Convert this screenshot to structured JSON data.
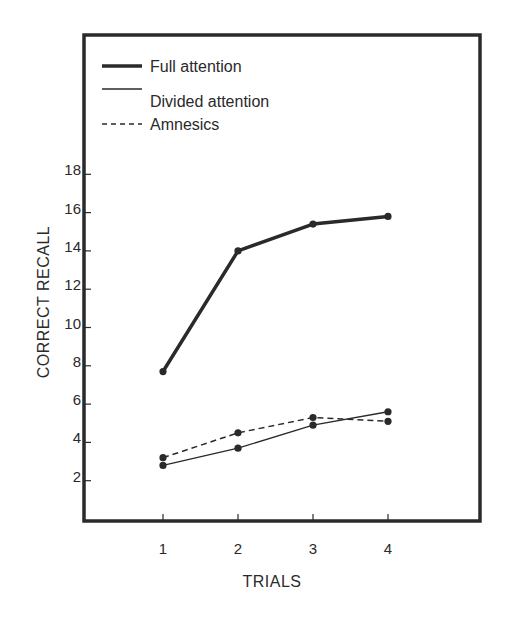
{
  "chart_data": {
    "type": "line",
    "title": "",
    "xlabel": "TRIALS",
    "ylabel": "CORRECT RECALL",
    "x": [
      1,
      2,
      3,
      4
    ],
    "x_tick_labels": [
      "1",
      "2",
      "3",
      "4"
    ],
    "y_ticks": [
      2,
      4,
      6,
      8,
      10,
      12,
      14,
      16,
      18
    ],
    "y_tick_labels": [
      "2",
      "4",
      "6",
      "8",
      "10",
      "12",
      "14",
      "16",
      "18"
    ],
    "xlim": [
      0,
      5.2
    ],
    "ylim": [
      0,
      24
    ],
    "grid": false,
    "legend_position": "upper left, inside frame",
    "series": [
      {
        "name": "Full attention",
        "style": "thick solid",
        "values": [
          7.7,
          14.0,
          15.4,
          15.8
        ]
      },
      {
        "name": "Divided attention",
        "style": "thin solid",
        "values": [
          2.8,
          3.7,
          4.9,
          5.6
        ]
      },
      {
        "name": "Amnesics",
        "style": "dashed",
        "values": [
          3.2,
          4.5,
          5.3,
          5.1
        ]
      }
    ]
  },
  "legend": {
    "items": [
      {
        "label": "Full attention"
      },
      {
        "label": "Divided attention"
      },
      {
        "label": "Amnesics"
      }
    ]
  },
  "colors": {
    "ink": "#2a2a2a",
    "background": "#ffffff"
  }
}
